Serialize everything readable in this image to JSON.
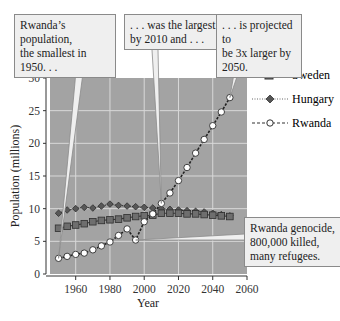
{
  "chart_data": {
    "type": "line",
    "title": "",
    "xlabel": "Year",
    "ylabel": "Population (millions)",
    "xlim": [
      1945,
      2060
    ],
    "ylim": [
      0,
      30
    ],
    "x_ticks": [
      1960,
      1980,
      2000,
      2020,
      2040,
      2060
    ],
    "y_ticks": [
      0,
      5,
      10,
      15,
      20,
      25,
      30
    ],
    "grid": true,
    "legend_position": "right",
    "x": [
      1950,
      1955,
      1960,
      1965,
      1970,
      1975,
      1980,
      1985,
      1990,
      1995,
      2000,
      2005,
      2010,
      2015,
      2020,
      2025,
      2030,
      2035,
      2040,
      2045,
      2050
    ],
    "series": [
      {
        "name": "Sweden",
        "marker": "square",
        "line": "solid",
        "color": "#6e6e6e",
        "values": [
          7.0,
          7.3,
          7.5,
          7.7,
          8.0,
          8.2,
          8.3,
          8.4,
          8.6,
          8.8,
          8.9,
          9.0,
          9.3,
          9.3,
          9.3,
          9.2,
          9.2,
          9.1,
          9.0,
          8.9,
          8.8
        ]
      },
      {
        "name": "Hungary",
        "marker": "diamond",
        "line": "dotted",
        "color": "#555555",
        "values": [
          9.3,
          9.8,
          10.0,
          10.2,
          10.1,
          10.4,
          10.7,
          10.5,
          10.4,
          10.3,
          10.2,
          10.1,
          10.0,
          9.9,
          9.8,
          9.7,
          9.6,
          9.5,
          9.3,
          9.1,
          8.9
        ]
      },
      {
        "name": "Rwanda",
        "marker": "circle-open",
        "line": "dashed",
        "color": "#222222",
        "values": [
          2.4,
          2.7,
          3.0,
          3.2,
          3.7,
          4.3,
          4.9,
          5.9,
          6.9,
          5.2,
          8.0,
          9.2,
          10.8,
          12.4,
          14.3,
          16.3,
          18.5,
          20.6,
          22.7,
          24.8,
          27.0
        ]
      }
    ],
    "annotations": [
      {
        "text": "Rwanda's population, the smallest in 1950. . .",
        "points_to": [
          1950,
          2.4
        ]
      },
      {
        "text": ". . . was the largest by 2010 and . . .",
        "points_to": [
          2010,
          10.8
        ]
      },
      {
        "text": ". . . is projected to be 3x larger by 2050.",
        "points_to": [
          2050,
          27.0
        ]
      },
      {
        "text": "Rwanda genocide, 800,000 killed, many refugees.",
        "points_to": [
          1995,
          5.2
        ]
      }
    ]
  },
  "callouts": {
    "c1": {
      "line1": "Rwanda’s population,",
      "line2": "the smallest in 1950. . ."
    },
    "c2": {
      "line1": ". . . was the largest",
      "line2": "by 2010 and . . ."
    },
    "c3": {
      "line1": ". . . is projected to",
      "line2": "be 3x larger by",
      "line3": "2050."
    },
    "c4": {
      "line1": "Rwanda genocide,",
      "line2": "800,000 killed,",
      "line3": "many refugees."
    }
  },
  "legend": {
    "sweden": "Sweden",
    "hungary": "Hungary",
    "rwanda": "Rwanda"
  },
  "axes": {
    "xlabel": "Year",
    "ylabel": "Population (millions)"
  },
  "colors": {
    "plot_bg": "#a3a3a3",
    "grid": "#d8d8d8",
    "callout_bg": "#efefef"
  }
}
